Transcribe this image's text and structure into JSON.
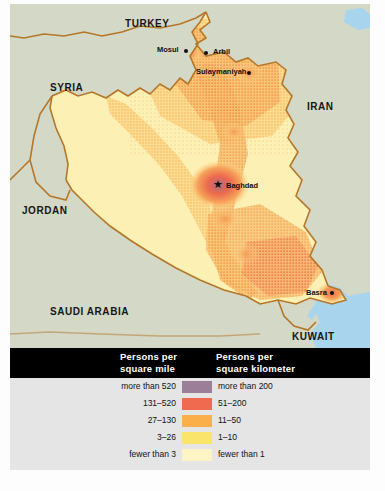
{
  "map": {
    "title": "Iraq Population Density",
    "colors": {
      "land_outside": "#d3d9c6",
      "iraq_base": "#fdf0b4",
      "water": "#a8d4ee",
      "border_line": "#b5762a",
      "label_text": "#161616"
    },
    "countries": [
      {
        "name": "TURKEY",
        "x": 115,
        "y": 14,
        "size": 10
      },
      {
        "name": "SYRIA",
        "x": 40,
        "y": 78,
        "size": 10
      },
      {
        "name": "IRAN",
        "x": 297,
        "y": 97,
        "size": 10
      },
      {
        "name": "JORDAN",
        "x": 12,
        "y": 201,
        "size": 10
      },
      {
        "name": "SAUDI ARABIA",
        "x": 40,
        "y": 302,
        "size": 10
      },
      {
        "name": "KUWAIT",
        "x": 282,
        "y": 327,
        "size": 10
      }
    ],
    "cities": [
      {
        "name": "Mosul",
        "label_x": 147,
        "label_y": 45,
        "dot_x": 176,
        "dot_y": 47,
        "capital": false
      },
      {
        "name": "Arbil",
        "label_x": 203,
        "label_y": 47,
        "dot_x": 196,
        "dot_y": 49,
        "capital": false
      },
      {
        "name": "Sulaymaniyah",
        "label_x": 186,
        "label_y": 67,
        "dot_x": 239,
        "dot_y": 69,
        "capital": false
      },
      {
        "name": "Baghdad",
        "label_x": 216,
        "label_y": 181,
        "dot_x": 209,
        "dot_y": 181,
        "capital": true
      },
      {
        "name": "Basra",
        "label_x": 296,
        "label_y": 288,
        "dot_x": 322,
        "dot_y": 289,
        "capital": false
      }
    ]
  },
  "legend": {
    "header": {
      "col_mile_line1": "Persons per",
      "col_mile_line2": "square mile",
      "col_km_line1": "Persons per",
      "col_km_line2": "square kilometer"
    },
    "rows": [
      {
        "per_mile": "more than 520",
        "per_km": "more than 200",
        "color": "#9c7e98"
      },
      {
        "per_mile": "131–520",
        "per_km": "51–200",
        "color": "#f06a4f"
      },
      {
        "per_mile": "27–130",
        "per_km": "11–50",
        "color": "#fbaf4a"
      },
      {
        "per_mile": "3–26",
        "per_km": "1–10",
        "color": "#fbe46a"
      },
      {
        "per_mile": "fewer than 3",
        "per_km": "fewer than 1",
        "color": "#fcf4c4"
      }
    ]
  }
}
